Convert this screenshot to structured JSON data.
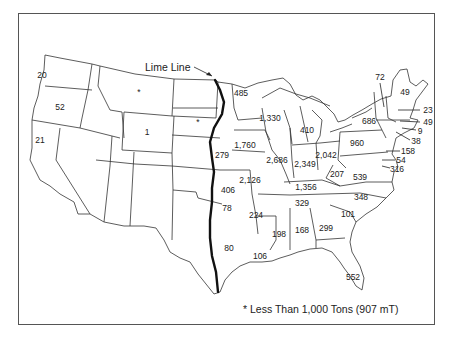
{
  "map": {
    "title_label": "Lime Line",
    "footnote": "* Less Than 1,000 Tons (907 mT)",
    "values": [
      {
        "state": "WA",
        "value": "20",
        "x": 42,
        "y": 75
      },
      {
        "state": "OR",
        "value": "52",
        "x": 60,
        "y": 107
      },
      {
        "state": "CA",
        "value": "21",
        "x": 40,
        "y": 140
      },
      {
        "state": "MT",
        "value": "*",
        "x": 139,
        "y": 92
      },
      {
        "state": "WY",
        "value": "1",
        "x": 147,
        "y": 132
      },
      {
        "state": "SD",
        "value": "*",
        "x": 198,
        "y": 122
      },
      {
        "state": "MN",
        "value": "485",
        "x": 241,
        "y": 93
      },
      {
        "state": "NE/KS-border",
        "value": "279",
        "x": 222,
        "y": 155
      },
      {
        "state": "WI",
        "value": "1,330",
        "x": 270,
        "y": 118
      },
      {
        "state": "MI",
        "value": "410",
        "x": 307,
        "y": 130
      },
      {
        "state": "IA",
        "value": "1,760",
        "x": 245,
        "y": 145
      },
      {
        "state": "IL",
        "value": "2,686",
        "x": 277,
        "y": 160
      },
      {
        "state": "IN",
        "value": "2,349",
        "x": 305,
        "y": 164
      },
      {
        "state": "OH",
        "value": "2,042",
        "x": 326,
        "y": 155
      },
      {
        "state": "PA",
        "value": "960",
        "x": 357,
        "y": 143
      },
      {
        "state": "NY",
        "value": "686",
        "x": 369,
        "y": 121
      },
      {
        "state": "MO",
        "value": "2,126",
        "x": 250,
        "y": 180
      },
      {
        "state": "KS",
        "value": "406",
        "x": 228,
        "y": 190
      },
      {
        "state": "KY",
        "value": "1,356",
        "x": 306,
        "y": 187
      },
      {
        "state": "WV",
        "value": "207",
        "x": 337,
        "y": 174
      },
      {
        "state": "VA",
        "value": "539",
        "x": 360,
        "y": 177
      },
      {
        "state": "OK",
        "value": "78",
        "x": 227,
        "y": 208
      },
      {
        "state": "AR",
        "value": "224",
        "x": 256,
        "y": 215
      },
      {
        "state": "TN",
        "value": "329",
        "x": 302,
        "y": 203
      },
      {
        "state": "NC",
        "value": "348",
        "x": 361,
        "y": 197
      },
      {
        "state": "SC",
        "value": "101",
        "x": 348,
        "y": 214
      },
      {
        "state": "MS",
        "value": "198",
        "x": 279,
        "y": 234
      },
      {
        "state": "AL",
        "value": "168",
        "x": 302,
        "y": 230
      },
      {
        "state": "GA",
        "value": "299",
        "x": 326,
        "y": 228
      },
      {
        "state": "TX",
        "value": "80",
        "x": 229,
        "y": 248
      },
      {
        "state": "LA",
        "value": "106",
        "x": 260,
        "y": 256
      },
      {
        "state": "FL",
        "value": "552",
        "x": 353,
        "y": 277
      }
    ],
    "callouts": [
      {
        "state": "VT",
        "value": "72",
        "x": 380,
        "y": 77
      },
      {
        "state": "ME",
        "value": "49",
        "x": 405,
        "y": 92
      },
      {
        "state": "NH",
        "value": "23",
        "x": 428,
        "y": 110
      },
      {
        "state": "MA",
        "value": "49",
        "x": 428,
        "y": 122
      },
      {
        "state": "RI",
        "value": "9",
        "x": 420,
        "y": 131
      },
      {
        "state": "CT",
        "value": "38",
        "x": 416,
        "y": 141
      },
      {
        "state": "NJ",
        "value": "158",
        "x": 408,
        "y": 151
      },
      {
        "state": "DE",
        "value": "54",
        "x": 401,
        "y": 160
      },
      {
        "state": "MD",
        "value": "316",
        "x": 397,
        "y": 169
      }
    ]
  }
}
